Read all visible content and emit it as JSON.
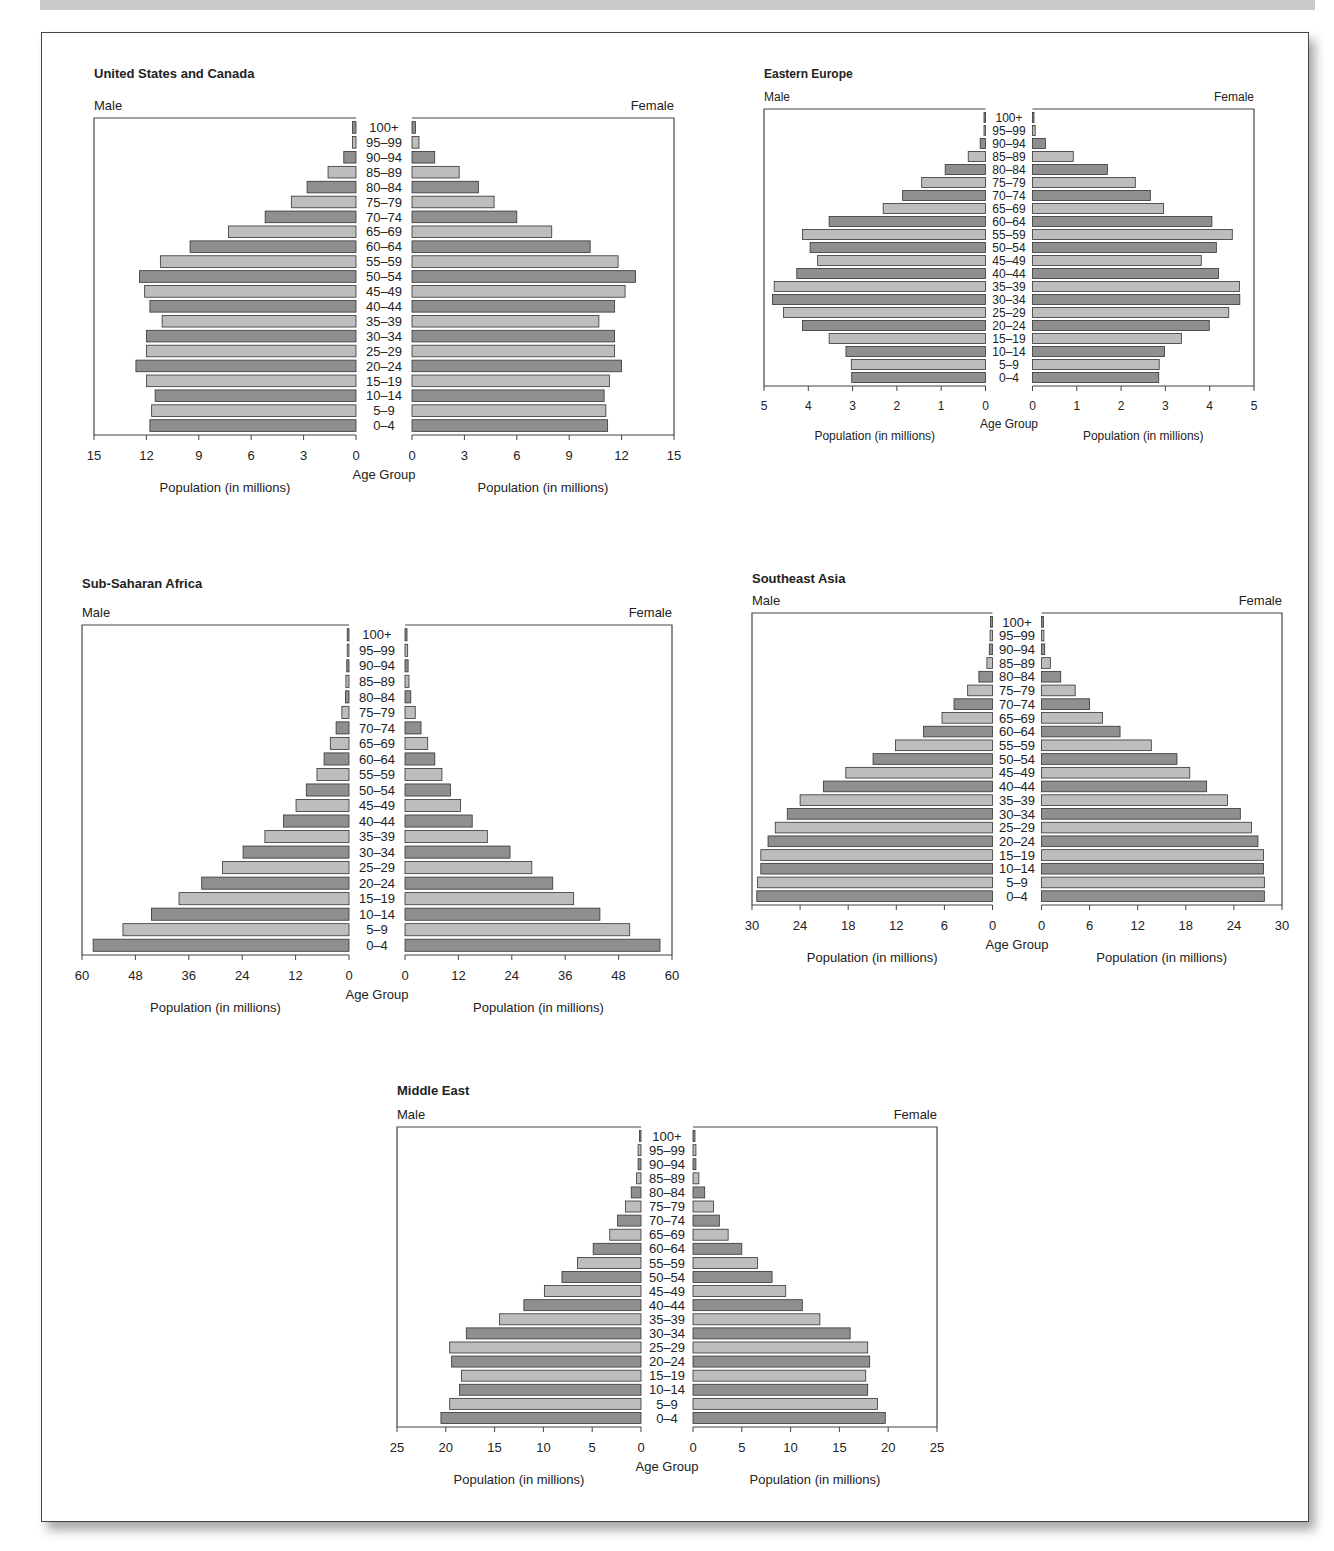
{
  "page": {
    "age_group_label": "Age Group",
    "male_label": "Male",
    "female_label": "Female",
    "population_axis_label": "Population (in millions)",
    "colors": {
      "bar_light": "#bdbdbd",
      "bar_dark": "#8f8f8f",
      "bar_stroke": "#333333",
      "frame": "#444444"
    }
  },
  "chart_data": [
    {
      "type": "bar",
      "subtype": "population-pyramid",
      "title": "United States and Canada",
      "xlabel": "Population (in millions)",
      "ylabel": "Age Group",
      "legend": [
        "Male",
        "Female"
      ],
      "xlim": [
        0,
        15
      ],
      "ticks": [
        0,
        3,
        6,
        9,
        12,
        15
      ],
      "categories": [
        "100+",
        "95–99",
        "90–94",
        "85–89",
        "80–84",
        "75–79",
        "70–74",
        "65–69",
        "60–64",
        "55–59",
        "50–54",
        "45–49",
        "40–44",
        "35–39",
        "30–34",
        "25–29",
        "20–24",
        "15–19",
        "10–14",
        "5–9",
        "0–4"
      ],
      "series": [
        {
          "name": "Male",
          "values": [
            0.2,
            0.2,
            0.7,
            1.6,
            2.8,
            3.7,
            5.2,
            7.3,
            9.5,
            11.2,
            12.4,
            12.1,
            11.8,
            11.1,
            12.0,
            12.0,
            12.6,
            12.0,
            11.5,
            11.7,
            11.8
          ]
        },
        {
          "name": "Female",
          "values": [
            0.2,
            0.4,
            1.3,
            2.7,
            3.8,
            4.7,
            6.0,
            8.0,
            10.2,
            11.8,
            12.8,
            12.2,
            11.6,
            10.7,
            11.6,
            11.6,
            12.0,
            11.3,
            11.0,
            11.1,
            11.2
          ]
        }
      ],
      "layout": {
        "x": 90,
        "y": 65,
        "w": 590,
        "h": 440,
        "center_gap": 56,
        "plot_top": 53,
        "plot_bottom": 370,
        "font": 13
      }
    },
    {
      "type": "bar",
      "subtype": "population-pyramid",
      "title": "Eastern Europe",
      "xlabel": "Population (in millions)",
      "ylabel": "Age Group",
      "legend": [
        "Male",
        "Female"
      ],
      "xlim": [
        0,
        5
      ],
      "ticks": [
        0,
        1,
        2,
        3,
        4,
        5
      ],
      "categories": [
        "100+",
        "95–99",
        "90–94",
        "85–89",
        "80–84",
        "75–79",
        "70–74",
        "65–69",
        "60–64",
        "55–59",
        "50–54",
        "45–49",
        "40–44",
        "35–39",
        "30–34",
        "25–29",
        "20–24",
        "15–19",
        "10–14",
        "5–9",
        "0–4"
      ],
      "series": [
        {
          "name": "Male",
          "values": [
            0.03,
            0.03,
            0.12,
            0.39,
            0.91,
            1.44,
            1.87,
            2.31,
            3.53,
            4.13,
            3.96,
            3.79,
            4.26,
            4.77,
            4.81,
            4.56,
            4.13,
            3.53,
            3.15,
            3.03,
            3.02
          ]
        },
        {
          "name": "Female",
          "values": [
            0.03,
            0.06,
            0.29,
            0.92,
            1.69,
            2.32,
            2.66,
            2.96,
            4.05,
            4.51,
            4.15,
            3.81,
            4.2,
            4.67,
            4.68,
            4.43,
            3.99,
            3.36,
            2.98,
            2.86,
            2.85
          ]
        }
      ],
      "layout": {
        "x": 760,
        "y": 66,
        "w": 500,
        "h": 380,
        "center_gap": 47,
        "plot_top": 43,
        "plot_bottom": 320,
        "font": 12
      }
    },
    {
      "type": "bar",
      "subtype": "population-pyramid",
      "title": "Sub-Saharan Africa",
      "xlabel": "Population (in millions)",
      "ylabel": "Age Group",
      "legend": [
        "Male",
        "Female"
      ],
      "xlim": [
        0,
        60
      ],
      "ticks": [
        0,
        12,
        24,
        36,
        48,
        60
      ],
      "categories": [
        "100+",
        "95–99",
        "90–94",
        "85–89",
        "80–84",
        "75–79",
        "70–74",
        "65–69",
        "60–64",
        "55–59",
        "50–54",
        "45–49",
        "40–44",
        "35–39",
        "30–34",
        "25–29",
        "20–24",
        "15–19",
        "10–14",
        "5–9",
        "0–4"
      ],
      "series": [
        {
          "name": "Male",
          "values": [
            0.4,
            0.4,
            0.5,
            0.7,
            0.8,
            1.6,
            2.9,
            4.2,
            5.6,
            7.2,
            9.6,
            11.9,
            14.7,
            18.9,
            23.8,
            28.4,
            33.1,
            38.2,
            44.4,
            50.8,
            57.5
          ]
        },
        {
          "name": "Female",
          "values": [
            0.45,
            0.6,
            0.7,
            0.9,
            1.3,
            2.3,
            3.6,
            5.1,
            6.7,
            8.3,
            10.2,
            12.5,
            15.1,
            18.5,
            23.6,
            28.5,
            33.2,
            37.9,
            43.8,
            50.5,
            57.3
          ]
        }
      ],
      "layout": {
        "x": 78,
        "y": 575,
        "w": 600,
        "h": 450,
        "center_gap": 56,
        "plot_top": 50,
        "plot_bottom": 380,
        "font": 13
      }
    },
    {
      "type": "bar",
      "subtype": "population-pyramid",
      "title": "Southeast Asia",
      "xlabel": "Population (in millions)",
      "ylabel": "Age Group",
      "legend": [
        "Male",
        "Female"
      ],
      "xlim": [
        0,
        30
      ],
      "ticks": [
        0,
        6,
        12,
        18,
        24,
        30
      ],
      "categories": [
        "100+",
        "95–99",
        "90–94",
        "85–89",
        "80–84",
        "75–79",
        "70–74",
        "65–69",
        "60–64",
        "55–59",
        "50–54",
        "45–49",
        "40–44",
        "35–39",
        "30–34",
        "25–29",
        "20–24",
        "15–19",
        "10–14",
        "5–9",
        "0–4"
      ],
      "series": [
        {
          "name": "Male",
          "values": [
            0.25,
            0.3,
            0.4,
            0.7,
            1.7,
            3.1,
            4.8,
            6.3,
            8.6,
            12.1,
            14.9,
            18.3,
            21.1,
            24.0,
            25.6,
            27.1,
            28.0,
            28.9,
            28.9,
            29.3,
            29.4
          ]
        },
        {
          "name": "Female",
          "values": [
            0.25,
            0.3,
            0.4,
            1.1,
            2.4,
            4.2,
            6.0,
            7.6,
            9.8,
            13.7,
            16.9,
            18.5,
            20.6,
            23.2,
            24.8,
            26.2,
            27.0,
            27.7,
            27.7,
            27.8,
            27.8
          ]
        }
      ],
      "layout": {
        "x": 748,
        "y": 570,
        "w": 540,
        "h": 400,
        "center_gap": 49,
        "plot_top": 43,
        "plot_bottom": 335,
        "font": 13
      }
    },
    {
      "type": "bar",
      "subtype": "population-pyramid",
      "title": "Middle East",
      "xlabel": "Population (in millions)",
      "ylabel": "Age Group",
      "legend": [
        "Male",
        "Female"
      ],
      "xlim": [
        0,
        25
      ],
      "ticks": [
        0,
        5,
        10,
        15,
        20,
        25
      ],
      "categories": [
        "100+",
        "95–99",
        "90–94",
        "85–89",
        "80–84",
        "75–79",
        "70–74",
        "65–69",
        "60–64",
        "55–59",
        "50–54",
        "45–49",
        "40–44",
        "35–39",
        "30–34",
        "25–29",
        "20–24",
        "15–19",
        "10–14",
        "5–9",
        "0–4"
      ],
      "series": [
        {
          "name": "Male",
          "values": [
            0.14,
            0.3,
            0.3,
            0.45,
            1.0,
            1.6,
            2.4,
            3.2,
            4.9,
            6.5,
            8.1,
            9.9,
            12.0,
            14.5,
            17.9,
            19.6,
            19.4,
            18.4,
            18.6,
            19.6,
            20.5
          ]
        },
        {
          "name": "Female",
          "values": [
            0.2,
            0.3,
            0.3,
            0.6,
            1.2,
            2.1,
            2.7,
            3.6,
            5.0,
            6.6,
            8.1,
            9.5,
            11.2,
            13.0,
            16.1,
            17.9,
            18.1,
            17.7,
            17.9,
            18.9,
            19.7
          ]
        }
      ],
      "layout": {
        "x": 393,
        "y": 1082,
        "w": 550,
        "h": 410,
        "center_gap": 52,
        "plot_top": 45,
        "plot_bottom": 345,
        "font": 13
      }
    }
  ]
}
